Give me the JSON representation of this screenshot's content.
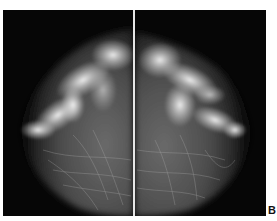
{
  "figure": {
    "label": "B",
    "panels": [
      {
        "name": "left-breast-view"
      },
      {
        "name": "right-breast-view"
      }
    ]
  }
}
